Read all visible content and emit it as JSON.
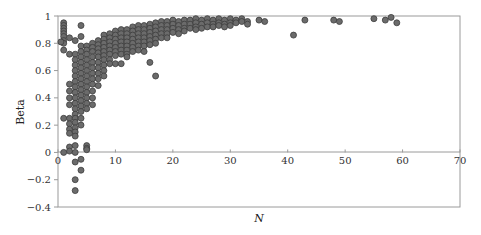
{
  "chart_data": {
    "type": "scatter",
    "title": "",
    "xlabel": "N",
    "ylabel": "Beta",
    "xlim": [
      0,
      70
    ],
    "ylim": [
      -0.4,
      1
    ],
    "xticks": [
      0,
      10,
      20,
      30,
      40,
      50,
      60,
      70
    ],
    "yticks": [
      -0.4,
      -0.2,
      0,
      0.2,
      0.4,
      0.6,
      0.8,
      1
    ],
    "xtick_labels": [
      "0",
      "10",
      "20",
      "30",
      "40",
      "50",
      "60",
      "70"
    ],
    "ytick_labels": [
      "−0.4",
      "−0.2",
      "0",
      "0.2",
      "0.4",
      "0.6",
      "0.8",
      "1"
    ],
    "grid": false,
    "legend": null,
    "marker": {
      "shape": "circle",
      "fill": "#6b6b6b",
      "edge": "#3c3c3c",
      "radius": 3
    },
    "series": [
      {
        "name": "Beta vs N",
        "points": [
          [
            1,
            0.95
          ],
          [
            1,
            0.93
          ],
          [
            1,
            0.91
          ],
          [
            1,
            0.89
          ],
          [
            1,
            0.87
          ],
          [
            1,
            0.85
          ],
          [
            1,
            0.82
          ],
          [
            1,
            0.8
          ],
          [
            1,
            0.75
          ],
          [
            0.5,
            0.81
          ],
          [
            1,
            0.0
          ],
          [
            1,
            0.25
          ],
          [
            2,
            0.84
          ],
          [
            2,
            0.72
          ],
          [
            2,
            0.25
          ],
          [
            2,
            0.21
          ],
          [
            2,
            0.17
          ],
          [
            2,
            0.14
          ],
          [
            2,
            0.04
          ],
          [
            2,
            0.01
          ],
          [
            2,
            0.5
          ],
          [
            2,
            0.45
          ],
          [
            2,
            0.4
          ],
          [
            2,
            0.35
          ],
          [
            3,
            0.82
          ],
          [
            3,
            0.72
          ],
          [
            3,
            0.68
          ],
          [
            3,
            0.64
          ],
          [
            3,
            0.6
          ],
          [
            3,
            0.56
          ],
          [
            3,
            0.52
          ],
          [
            3,
            0.48
          ],
          [
            3,
            0.44
          ],
          [
            3,
            0.4
          ],
          [
            3,
            0.36
          ],
          [
            3,
            0.32
          ],
          [
            3,
            0.28
          ],
          [
            3,
            0.25
          ],
          [
            3,
            0.22
          ],
          [
            3,
            0.18
          ],
          [
            3,
            0.15
          ],
          [
            3,
            0.12
          ],
          [
            3,
            0.05
          ],
          [
            3,
            0.0
          ],
          [
            3,
            -0.07
          ],
          [
            3,
            -0.2
          ],
          [
            3,
            -0.28
          ],
          [
            4,
            0.93
          ],
          [
            4,
            0.85
          ],
          [
            4,
            0.78
          ],
          [
            4,
            0.74
          ],
          [
            4,
            0.7
          ],
          [
            4,
            0.66
          ],
          [
            4,
            0.62
          ],
          [
            4,
            0.58
          ],
          [
            4,
            0.54
          ],
          [
            4,
            0.5
          ],
          [
            4,
            0.46
          ],
          [
            4,
            0.42
          ],
          [
            4,
            0.38
          ],
          [
            4,
            0.34
          ],
          [
            4,
            0.3
          ],
          [
            4,
            0.25
          ],
          [
            4,
            0.2
          ],
          [
            4,
            -0.05
          ],
          [
            4,
            -0.13
          ],
          [
            5,
            0.78
          ],
          [
            5,
            0.75
          ],
          [
            5,
            0.72
          ],
          [
            5,
            0.68
          ],
          [
            5,
            0.64
          ],
          [
            5,
            0.6
          ],
          [
            5,
            0.56
          ],
          [
            5,
            0.52
          ],
          [
            5,
            0.48
          ],
          [
            5,
            0.44
          ],
          [
            5,
            0.4
          ],
          [
            5,
            0.36
          ],
          [
            5,
            0.32
          ],
          [
            5,
            0.05
          ],
          [
            5,
            0.03
          ],
          [
            5,
            0.02
          ],
          [
            6,
            0.8
          ],
          [
            6,
            0.77
          ],
          [
            6,
            0.74
          ],
          [
            6,
            0.7
          ],
          [
            6,
            0.66
          ],
          [
            6,
            0.62
          ],
          [
            6,
            0.58
          ],
          [
            6,
            0.54
          ],
          [
            6,
            0.5
          ],
          [
            6,
            0.45
          ],
          [
            6,
            0.4
          ],
          [
            6,
            0.35
          ],
          [
            7,
            0.82
          ],
          [
            7,
            0.79
          ],
          [
            7,
            0.76
          ],
          [
            7,
            0.73
          ],
          [
            7,
            0.7
          ],
          [
            7,
            0.66
          ],
          [
            7,
            0.62
          ],
          [
            7,
            0.58
          ],
          [
            7,
            0.54
          ],
          [
            7,
            0.49
          ],
          [
            8,
            0.86
          ],
          [
            8,
            0.83
          ],
          [
            8,
            0.8
          ],
          [
            8,
            0.77
          ],
          [
            8,
            0.74
          ],
          [
            8,
            0.71
          ],
          [
            8,
            0.68
          ],
          [
            8,
            0.64
          ],
          [
            8,
            0.6
          ],
          [
            8,
            0.56
          ],
          [
            9,
            0.87
          ],
          [
            9,
            0.84
          ],
          [
            9,
            0.81
          ],
          [
            9,
            0.78
          ],
          [
            9,
            0.75
          ],
          [
            9,
            0.72
          ],
          [
            9,
            0.68
          ],
          [
            9,
            0.65
          ],
          [
            10,
            0.89
          ],
          [
            10,
            0.86
          ],
          [
            10,
            0.83
          ],
          [
            10,
            0.8
          ],
          [
            10,
            0.77
          ],
          [
            10,
            0.74
          ],
          [
            10,
            0.71
          ],
          [
            10,
            0.65
          ],
          [
            11,
            0.9
          ],
          [
            11,
            0.87
          ],
          [
            11,
            0.84
          ],
          [
            11,
            0.81
          ],
          [
            11,
            0.78
          ],
          [
            11,
            0.75
          ],
          [
            11,
            0.72
          ],
          [
            11,
            0.65
          ],
          [
            12,
            0.9
          ],
          [
            12,
            0.87
          ],
          [
            12,
            0.84
          ],
          [
            12,
            0.81
          ],
          [
            12,
            0.78
          ],
          [
            12,
            0.75
          ],
          [
            12,
            0.72
          ],
          [
            12,
            0.7
          ],
          [
            13,
            0.92
          ],
          [
            13,
            0.89
          ],
          [
            13,
            0.86
          ],
          [
            13,
            0.83
          ],
          [
            13,
            0.8
          ],
          [
            13,
            0.77
          ],
          [
            13,
            0.74
          ],
          [
            14,
            0.93
          ],
          [
            14,
            0.9
          ],
          [
            14,
            0.87
          ],
          [
            14,
            0.84
          ],
          [
            14,
            0.81
          ],
          [
            14,
            0.78
          ],
          [
            14,
            0.75
          ],
          [
            15,
            0.93
          ],
          [
            15,
            0.9
          ],
          [
            15,
            0.87
          ],
          [
            15,
            0.84
          ],
          [
            15,
            0.81
          ],
          [
            15,
            0.78
          ],
          [
            15,
            0.74
          ],
          [
            16,
            0.94
          ],
          [
            16,
            0.91
          ],
          [
            16,
            0.88
          ],
          [
            16,
            0.85
          ],
          [
            16,
            0.82
          ],
          [
            16,
            0.79
          ],
          [
            16,
            0.66
          ],
          [
            17,
            0.95
          ],
          [
            17,
            0.92
          ],
          [
            17,
            0.89
          ],
          [
            17,
            0.86
          ],
          [
            17,
            0.83
          ],
          [
            17,
            0.8
          ],
          [
            17,
            0.56
          ],
          [
            18,
            0.96
          ],
          [
            18,
            0.93
          ],
          [
            18,
            0.9
          ],
          [
            18,
            0.87
          ],
          [
            18,
            0.84
          ],
          [
            19,
            0.96
          ],
          [
            19,
            0.93
          ],
          [
            19,
            0.9
          ],
          [
            19,
            0.87
          ],
          [
            19,
            0.84
          ],
          [
            20,
            0.97
          ],
          [
            20,
            0.94
          ],
          [
            20,
            0.91
          ],
          [
            20,
            0.88
          ],
          [
            21,
            0.96
          ],
          [
            21,
            0.93
          ],
          [
            21,
            0.9
          ],
          [
            21,
            0.87
          ],
          [
            22,
            0.97
          ],
          [
            22,
            0.94
          ],
          [
            22,
            0.91
          ],
          [
            22,
            0.89
          ],
          [
            23,
            0.97
          ],
          [
            23,
            0.94
          ],
          [
            23,
            0.91
          ],
          [
            24,
            0.98
          ],
          [
            24,
            0.95
          ],
          [
            24,
            0.92
          ],
          [
            24,
            0.9
          ],
          [
            25,
            0.97
          ],
          [
            25,
            0.94
          ],
          [
            25,
            0.91
          ],
          [
            26,
            0.98
          ],
          [
            26,
            0.95
          ],
          [
            26,
            0.92
          ],
          [
            27,
            0.97
          ],
          [
            27,
            0.94
          ],
          [
            27,
            0.92
          ],
          [
            28,
            0.98
          ],
          [
            28,
            0.95
          ],
          [
            28,
            0.93
          ],
          [
            29,
            0.97
          ],
          [
            29,
            0.94
          ],
          [
            29,
            0.92
          ],
          [
            30,
            0.98
          ],
          [
            30,
            0.95
          ],
          [
            30,
            0.93
          ],
          [
            31,
            0.97
          ],
          [
            31,
            0.95
          ],
          [
            32,
            0.98
          ],
          [
            32,
            0.96
          ],
          [
            33,
            0.96
          ],
          [
            33,
            0.94
          ],
          [
            35,
            0.97
          ],
          [
            36,
            0.96
          ],
          [
            41,
            0.86
          ],
          [
            43,
            0.97
          ],
          [
            48,
            0.97
          ],
          [
            49,
            0.96
          ],
          [
            55,
            0.98
          ],
          [
            57,
            0.97
          ],
          [
            58,
            0.99
          ],
          [
            59,
            0.95
          ]
        ]
      }
    ]
  }
}
